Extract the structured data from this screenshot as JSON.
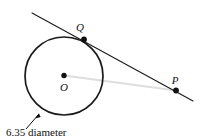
{
  "figure": {
    "background_color": "#ffffff",
    "stroke_color": "#1a1a1a",
    "faint_line_color": "#d9d9d9",
    "width": 200,
    "height": 139
  },
  "labels": {
    "center_point": "O",
    "tangent_point": "Q",
    "external_point": "P",
    "dimension": "6.35 diameter"
  },
  "geometry": {
    "circle": {
      "cx": 64,
      "cy": 76,
      "r": 39,
      "diameter_value": "6.35"
    },
    "points": [
      {
        "name": "O",
        "x": 64,
        "y": 75.5,
        "label_x": 64,
        "label_y": 91
      },
      {
        "name": "Q",
        "x": 84,
        "y": 39.5,
        "label_x": 80,
        "label_y": 31
      },
      {
        "name": "P",
        "x": 176,
        "y": 90.5,
        "label_x": 175,
        "label_y": 84
      }
    ],
    "tangent_line": {
      "x1": 32,
      "y1": 13,
      "x2": 193,
      "y2": 101
    },
    "chord_line": {
      "x1": 64,
      "y1": 75.5,
      "x2": 176,
      "y2": 90.5
    },
    "leader": {
      "tail_x": 26,
      "tail_y": 129,
      "head_x": 38.5,
      "head_y": 114
    },
    "dimension_text_pos": {
      "x": 6,
      "y": 136
    }
  }
}
